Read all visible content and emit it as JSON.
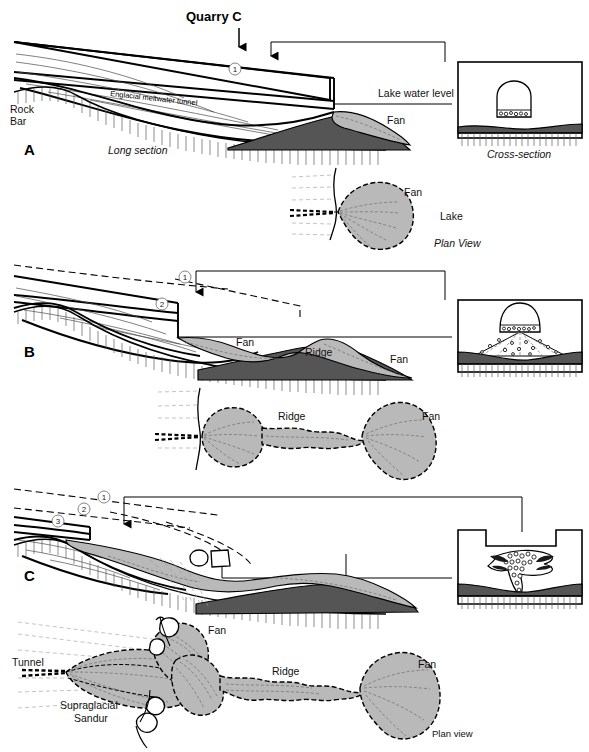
{
  "figure": {
    "title": "Quarry C",
    "width": 589,
    "height": 752
  },
  "colors": {
    "fan_light_grey": "#b9b9b9",
    "fan_dark_grey": "#555555",
    "ice_line": "#000000",
    "background": "#ffffff",
    "hatch_grey": "#5b5b5b"
  },
  "panels": [
    {
      "letter": "A",
      "long_section": {
        "view_label": "Long section",
        "labels": {
          "rock_bar_line1": "Rock",
          "rock_bar_line2": "Bar",
          "tunnel": "Englacial meltwater tunnel",
          "lake_level": "Lake water level",
          "fan": "Fan"
        },
        "markers": [
          "1"
        ]
      },
      "cross_section": {
        "view_label": "Cross-section"
      },
      "plan_view": {
        "view_label": "Plan View",
        "labels": {
          "fan": "Fan",
          "lake": "Lake"
        }
      }
    },
    {
      "letter": "B",
      "long_section": {
        "labels": {
          "fan_upper": "Fan",
          "ridge": "Ridge",
          "fan_lower": "Fan"
        },
        "markers": [
          "1",
          "2"
        ]
      },
      "cross_section": {
        "view_label": ""
      },
      "plan_view": {
        "view_label": "",
        "labels": {
          "ridge": "Ridge",
          "fan": "Fan"
        }
      }
    },
    {
      "letter": "C",
      "long_section": {
        "markers": [
          "1",
          "2",
          "3"
        ]
      },
      "cross_section": {
        "view_label": ""
      },
      "plan_view": {
        "view_label": "Plan view",
        "labels": {
          "tunnel": "Tunnel",
          "fan_upper": "Fan",
          "supraglacial_line1": "Supraglacial",
          "supraglacial_line2": "Sandur",
          "ridge": "Ridge",
          "fan_right": "Fan"
        }
      }
    }
  ]
}
